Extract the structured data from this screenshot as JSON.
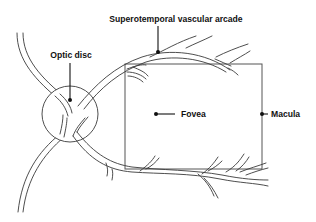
{
  "diagram": {
    "labels": {
      "arcade": "Superotemporal vascular arcade",
      "optic_disc": "Optic disc",
      "fovea": "Fovea",
      "macula": "Macula"
    },
    "colors": {
      "line": "#3a3a3a",
      "text": "#111111",
      "background": "#ffffff"
    }
  }
}
